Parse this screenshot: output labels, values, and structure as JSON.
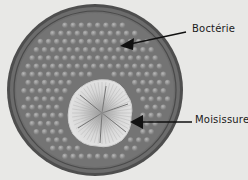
{
  "figure": {
    "labels": {
      "bacteria": "Boctérie",
      "mold": "Moisissure"
    },
    "colors": {
      "background": "#e8e8e6",
      "dish_rim": "#5a5a5a",
      "dish_fill": "#7a7a7a",
      "colony": "#9a9a9a",
      "mold": "#d6d6d6",
      "arrow": "#111111"
    }
  }
}
